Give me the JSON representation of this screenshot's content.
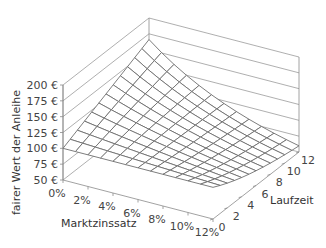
{
  "chart_data": {
    "type": "surface",
    "title": "",
    "xlabel": "Marktzinssatz",
    "ylabel": "Laufzeit",
    "zlabel": "fairer Wert der Anleihe",
    "x_ticks": [
      "0%",
      "2%",
      "4%",
      "6%",
      "8%",
      "10%",
      "12%"
    ],
    "x_values": [
      0,
      1,
      2,
      3,
      4,
      5,
      6,
      7,
      8,
      9,
      10,
      11,
      12
    ],
    "x_range": [
      0,
      12
    ],
    "y_ticks": [
      "0",
      "2",
      "4",
      "6",
      "8",
      "10",
      "12"
    ],
    "y_values": [
      0,
      1,
      2,
      3,
      4,
      5,
      6,
      7,
      8,
      9,
      10,
      11,
      12
    ],
    "y_range": [
      0,
      12
    ],
    "z_ticks": [
      "50 €",
      "75 €",
      "100 €",
      "125 €",
      "150 €",
      "175 €",
      "200 €"
    ],
    "z_range": [
      50,
      200
    ],
    "model": {
      "face_value": 100,
      "coupon": 5.5
    },
    "z_row_rate_0pct": [
      100,
      105.5,
      111,
      116.5,
      122,
      127.5,
      133,
      138.5,
      144,
      149.5,
      155,
      160.5,
      166
    ],
    "z_row_rate_12pct": [
      100,
      94.2,
      88.99,
      84.41,
      80.33,
      76.72,
      73.5,
      70.64,
      68.07,
      65.8,
      63.76,
      61.95,
      60.34
    ],
    "grid": true,
    "legend": null,
    "colors": {
      "mesh": "#6e6e6e",
      "frame": "#8a8a8a",
      "text": "#444444"
    }
  },
  "labels": {
    "z_axis_title": "fairer Wert der Anleihe",
    "x_axis_title": "Marktzinssatz",
    "y_axis_title": "Laufzeit"
  }
}
